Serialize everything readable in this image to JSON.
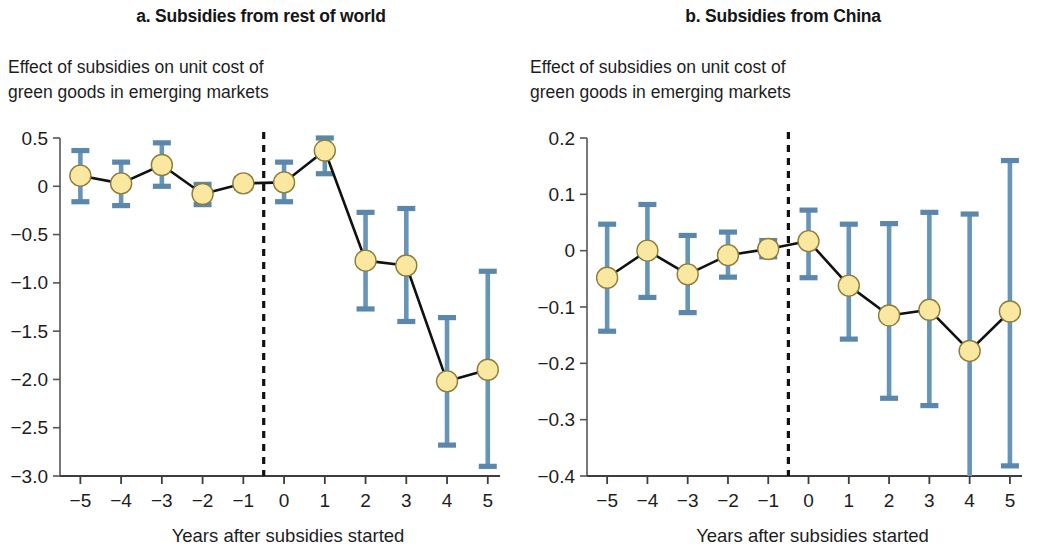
{
  "figure": {
    "background": "#ffffff",
    "marker_fill": "#fae8a0",
    "marker_stroke": "#8c7d3a",
    "errorbar_color": "#6795b8",
    "line_color": "#111111",
    "event_line_color": "#111111"
  },
  "panels": [
    {
      "id": "panel-a",
      "title": "a. Subsidies from rest of world",
      "subtitle": "Effect of subsidies on unit cost of\ngreen goods in emerging markets",
      "xlabel": "Years after subsidies started"
    },
    {
      "id": "panel-b",
      "title": "b. Subsidies from China",
      "subtitle": "Effect of subsidies on unit cost of\ngreen goods in emerging markets",
      "xlabel": "Years after subsidies started"
    }
  ],
  "chart_data": [
    {
      "type": "line",
      "panel": "a",
      "title": "a. Subsidies from rest of world",
      "subtitle": "Effect of subsidies on unit cost of green goods in emerging markets",
      "xlabel": "Years after subsidies started",
      "ylabel": "",
      "x": [
        -5,
        -4,
        -3,
        -2,
        -1,
        0,
        1,
        2,
        3,
        4,
        5
      ],
      "xticklabels": [
        "−5",
        "−4",
        "−3",
        "−2",
        "−1",
        "0",
        "1",
        "2",
        "3",
        "4",
        "5"
      ],
      "values": [
        0.11,
        0.03,
        0.22,
        -0.08,
        0.03,
        0.04,
        0.37,
        -0.77,
        -0.82,
        -2.02,
        -1.9
      ],
      "ci_low": [
        -0.16,
        -0.2,
        0.0,
        -0.19,
        -0.02,
        -0.16,
        0.13,
        -1.27,
        -1.4,
        -2.68,
        -2.9
      ],
      "ci_high": [
        0.37,
        0.25,
        0.45,
        0.02,
        0.08,
        0.25,
        0.52,
        -0.27,
        -0.23,
        -1.36,
        -0.88
      ],
      "yticks": [
        0.5,
        0,
        -0.5,
        -1.0,
        -1.5,
        -2.0,
        -2.5,
        -3.0
      ],
      "yticklabels": [
        "0.5",
        "0",
        "−0.5",
        "−1.0",
        "−1.5",
        "−2.0",
        "−2.5",
        "−3.0"
      ],
      "ylim": [
        -3.0,
        0.5
      ],
      "xlim": [
        -5.5,
        5.3
      ],
      "event_line_x": -0.5,
      "grid": false,
      "legend": "none",
      "error_bars": "95% confidence interval"
    },
    {
      "type": "line",
      "panel": "b",
      "title": "b. Subsidies from China",
      "subtitle": "Effect of subsidies on unit cost of green goods in emerging markets",
      "xlabel": "Years after subsidies started",
      "ylabel": "",
      "x": [
        -5,
        -4,
        -3,
        -2,
        -1,
        0,
        1,
        2,
        3,
        4,
        5
      ],
      "xticklabels": [
        "−5",
        "−4",
        "−3",
        "−2",
        "−1",
        "0",
        "1",
        "2",
        "3",
        "4",
        "5"
      ],
      "values": [
        -0.048,
        0.0,
        -0.042,
        -0.008,
        0.003,
        0.017,
        -0.062,
        -0.115,
        -0.105,
        -0.178,
        -0.108
      ],
      "ci_low": [
        -0.143,
        -0.083,
        -0.11,
        -0.047,
        -0.011,
        -0.048,
        -0.157,
        -0.262,
        -0.275,
        -0.43,
        -0.382
      ],
      "ci_high": [
        0.047,
        0.082,
        0.027,
        0.033,
        0.018,
        0.072,
        0.047,
        0.048,
        0.068,
        0.065,
        0.16
      ],
      "yticks": [
        0.2,
        0.1,
        0,
        -0.1,
        -0.2,
        -0.3,
        -0.4
      ],
      "yticklabels": [
        "0.2",
        "0.1",
        "0",
        "−0.1",
        "−0.2",
        "−0.3",
        "−0.4"
      ],
      "ylim": [
        -0.4,
        0.2
      ],
      "xlim": [
        -5.5,
        5.3
      ],
      "event_line_x": -0.5,
      "grid": false,
      "legend": "none",
      "error_bars": "95% confidence interval"
    }
  ]
}
